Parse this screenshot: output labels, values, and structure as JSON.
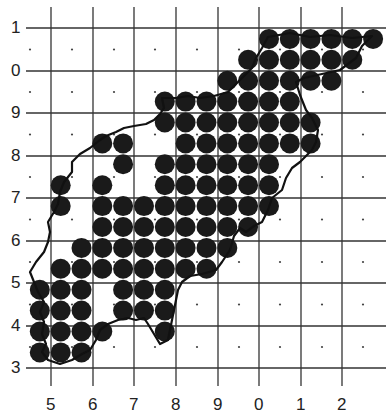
{
  "map": {
    "type": "grid-occupancy-map",
    "width": 389,
    "height": 418,
    "colors": {
      "background": "#ffffff",
      "grid": "#333333",
      "dot": "#444444",
      "circle": "#1a1a1a",
      "outline": "#111111"
    },
    "x_axis": {
      "labels": [
        "5",
        "6",
        "7",
        "8",
        "9",
        "0",
        "1",
        "2"
      ],
      "positions": [
        51,
        93,
        134,
        176,
        218,
        259,
        301,
        342
      ]
    },
    "y_axis": {
      "labels": [
        "1",
        "0",
        "9",
        "8",
        "7",
        "6",
        "5",
        "4",
        "3"
      ],
      "positions": [
        28,
        71,
        113,
        156,
        198,
        241,
        283,
        326,
        368
      ]
    },
    "circle_grid": {
      "x0": 19,
      "dx": 20.83,
      "y0": 18,
      "dy": 20.9,
      "radius": 10,
      "rows": {
        "1": [
          12,
          13,
          14,
          15,
          16,
          17
        ],
        "2": [
          11,
          12,
          13,
          14,
          15,
          16
        ],
        "3": [
          10,
          11,
          12,
          13,
          14,
          15
        ],
        "4": [
          7,
          8,
          9,
          10,
          11,
          12,
          13
        ],
        "5": [
          7,
          8,
          9,
          10,
          11,
          12,
          13,
          14
        ],
        "6": [
          4,
          5,
          8,
          9,
          10,
          11,
          12,
          13,
          14
        ],
        "7": [
          5,
          7,
          8,
          9,
          10,
          11,
          12
        ],
        "8": [
          2,
          4,
          7,
          8,
          9,
          10,
          11,
          12
        ],
        "9": [
          2,
          4,
          5,
          6,
          7,
          8,
          9,
          10,
          11,
          12
        ],
        "10": [
          4,
          5,
          6,
          7,
          8,
          9,
          10,
          11
        ],
        "11": [
          3,
          4,
          5,
          6,
          7,
          8,
          9,
          10
        ],
        "12": [
          2,
          3,
          4,
          5,
          6,
          7,
          8,
          9
        ],
        "13": [
          1,
          2,
          3,
          5,
          6,
          7
        ],
        "14": [
          1,
          2,
          3,
          5,
          6,
          7
        ],
        "15": [
          1,
          2,
          3,
          4,
          7
        ],
        "16": [
          1,
          2,
          3
        ]
      }
    },
    "outline_path": "M268,37 L290,33 L310,37 L330,35 L352,38 L372,36 L362,46 L356,58 L340,70 L322,74 L304,78 L296,82 L300,95 L306,110 L312,118 L318,130 L316,142 L312,150 L300,162 L292,168 L286,178 L282,190 L272,198 L268,210 L262,222 L254,226 L246,232 L240,228 L234,236 L230,250 L222,262 L216,270 L202,274 L190,276 L182,282 L178,290 L176,300 L174,310 L172,320 L170,330 L168,340 L160,344 L154,334 L148,324 L144,318 L136,320 L128,318 L118,320 L108,324 L100,330 L96,340 L90,350 L82,354 L72,360 L60,364 L48,360 L42,352 L46,344 L42,334 L44,322 L40,312 L44,302 L38,292 L34,282 L30,272 L36,262 L44,252 L48,242 L50,232 L48,222 L54,212 L58,204 L60,192 L64,182 L72,172 L72,162 L80,154 L90,148 L100,140 L106,136 L116,132 L124,128 L134,126 L146,124 L154,120 L160,114 L164,108 L162,98 L176,98 L188,96 L200,98 L214,96 L228,92 L236,84 L244,76 L252,68 L256,58 L262,48 L268,37 Z"
  }
}
